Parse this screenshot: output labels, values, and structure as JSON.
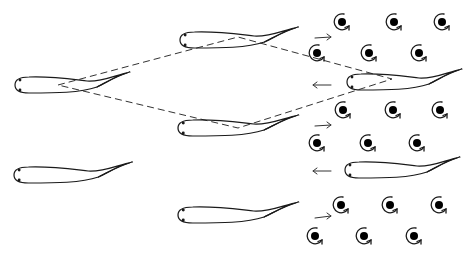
{
  "diagram": {
    "colors": {
      "stroke": "#1a1a1a",
      "background": "#ffffff",
      "vortex_core": "#000000"
    },
    "fish": [
      {
        "id": "fish-left-upper",
        "head_x": 15,
        "y": 85,
        "length": 115
      },
      {
        "id": "fish-middle-top",
        "head_x": 180,
        "y": 40,
        "length": 118
      },
      {
        "id": "fish-middle-center",
        "head_x": 178,
        "y": 128,
        "length": 120
      },
      {
        "id": "fish-right-upper",
        "head_x": 347,
        "y": 82,
        "length": 115
      },
      {
        "id": "fish-left-lower",
        "head_x": 14,
        "y": 175,
        "length": 118
      },
      {
        "id": "fish-middle-bottom",
        "head_x": 178,
        "y": 215,
        "length": 120
      },
      {
        "id": "fish-right-lower",
        "head_x": 345,
        "y": 170,
        "length": 115
      }
    ],
    "vortices": [
      {
        "x": 342,
        "y": 22
      },
      {
        "x": 394,
        "y": 22
      },
      {
        "x": 442,
        "y": 22
      },
      {
        "x": 317,
        "y": 53
      },
      {
        "x": 369,
        "y": 53
      },
      {
        "x": 419,
        "y": 53
      },
      {
        "x": 343,
        "y": 110
      },
      {
        "x": 393,
        "y": 110
      },
      {
        "x": 440,
        "y": 110
      },
      {
        "x": 317,
        "y": 143
      },
      {
        "x": 368,
        "y": 143
      },
      {
        "x": 417,
        "y": 143
      },
      {
        "x": 341,
        "y": 205
      },
      {
        "x": 390,
        "y": 205
      },
      {
        "x": 439,
        "y": 205
      },
      {
        "x": 315,
        "y": 236
      },
      {
        "x": 364,
        "y": 236
      },
      {
        "x": 414,
        "y": 236
      }
    ],
    "arrows": [
      {
        "direction": "right",
        "x1": 315,
        "y1": 38,
        "x2": 331,
        "y2": 37
      },
      {
        "direction": "left",
        "x1": 331,
        "y1": 85,
        "x2": 313,
        "y2": 85
      },
      {
        "direction": "right",
        "x1": 315,
        "y1": 126,
        "x2": 331,
        "y2": 125
      },
      {
        "direction": "left",
        "x1": 331,
        "y1": 171,
        "x2": 313,
        "y2": 171
      },
      {
        "direction": "right",
        "x1": 315,
        "y1": 218,
        "x2": 331,
        "y2": 216
      }
    ],
    "dashed_diamond": {
      "points": [
        [
          58,
          85
        ],
        [
          238,
          37
        ],
        [
          392,
          79
        ],
        [
          238,
          128
        ]
      ]
    }
  }
}
